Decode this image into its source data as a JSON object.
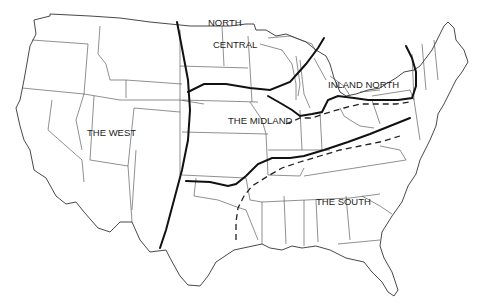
{
  "map": {
    "title": "",
    "type": "dialect-regions",
    "regions": [
      {
        "id": "west",
        "label": "THE WEST"
      },
      {
        "id": "north-central-1",
        "label": "NORTH"
      },
      {
        "id": "north-central-2",
        "label": "CENTRAL"
      },
      {
        "id": "inland-north",
        "label": "INLAND NORTH"
      },
      {
        "id": "midland",
        "label": "THE MIDLAND"
      },
      {
        "id": "south",
        "label": "THE SOUTH"
      }
    ],
    "colors": {
      "background": "#ffffff",
      "lines": "#111111",
      "borders": "#444444",
      "text": "#222222"
    }
  }
}
